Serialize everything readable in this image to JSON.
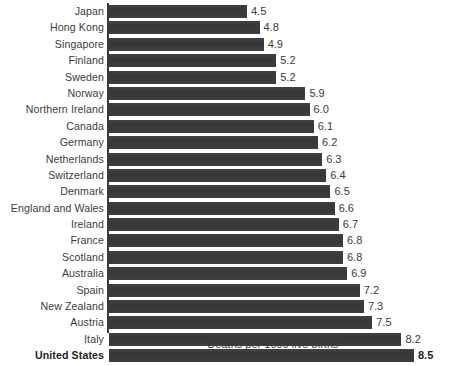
{
  "chart_data": {
    "type": "bar",
    "orientation": "horizontal",
    "title": "",
    "xlabel": "Deaths per 1000 live births",
    "ylabel": "",
    "grid": false,
    "legend": null,
    "xlim": [
      1.195,
      9.0
    ],
    "value_labels": true,
    "highlight_category": "United States",
    "categories": [
      "Japan",
      "Hong Kong",
      "Singapore",
      "Finland",
      "Sweden",
      "Norway",
      "Northern Ireland",
      "Canada",
      "Germany",
      "Netherlands",
      "Switzerland",
      "Denmark",
      "England and Wales",
      "Ireland",
      "France",
      "Scotland",
      "Australia",
      "Spain",
      "New Zealand",
      "Austria",
      "Italy",
      "United States"
    ],
    "values": [
      4.5,
      4.8,
      4.9,
      5.2,
      5.2,
      5.9,
      6.0,
      6.1,
      6.2,
      6.3,
      6.4,
      6.5,
      6.6,
      6.7,
      6.8,
      6.8,
      6.9,
      7.2,
      7.3,
      7.5,
      8.2,
      8.5
    ],
    "value_label_text": [
      "4.5",
      "4.8",
      "4.9",
      "5.2",
      "5.2",
      "5.9",
      "6.0",
      "6.1",
      "6.2",
      "6.3",
      "6.4",
      "6.5",
      "6.6",
      "6.7",
      "6.8",
      "6.8",
      "6.9",
      "7.2",
      "7.3",
      "7.5",
      "8.2",
      "8.5"
    ],
    "colors": {
      "bar": "#3a3a3a",
      "text": "#3b3b3b",
      "highlight_text": "#1d1d1d",
      "axis": "#3a3a3a",
      "background": "#ffffff"
    }
  }
}
